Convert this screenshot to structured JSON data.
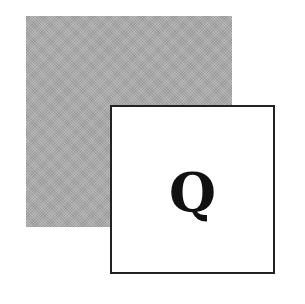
{
  "figure": {
    "background_square": {
      "fill_color": "#a9a9a9",
      "texture": "halftone"
    },
    "foreground_square": {
      "fill_color": "#ffffff",
      "border_color": "#222222",
      "letter": "Q"
    }
  }
}
